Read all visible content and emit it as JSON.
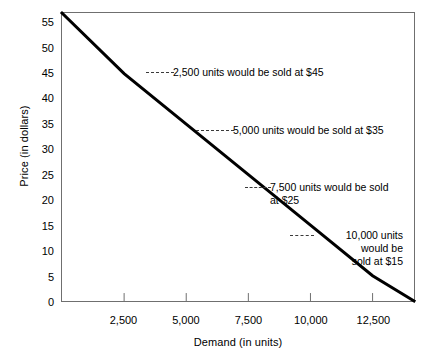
{
  "chart_data": {
    "type": "line",
    "title": "",
    "xlabel": "Demand (in units)",
    "ylabel": "Price (in dollars)",
    "xlim": [
      0,
      14167
    ],
    "ylim": [
      0,
      57
    ],
    "grid": false,
    "legend": "none",
    "x_ticks": [
      2500,
      5000,
      7500,
      10000,
      12500
    ],
    "x_tick_labels": [
      "2,500",
      "5,000",
      "7,500",
      "10,000",
      "12,500"
    ],
    "y_ticks": [
      0,
      5,
      10,
      15,
      20,
      25,
      30,
      35,
      40,
      45,
      50,
      55
    ],
    "y_tick_labels": [
      "0",
      "5",
      "10",
      "15",
      "20",
      "25",
      "30",
      "35",
      "40",
      "45",
      "50",
      "55"
    ],
    "series": [
      {
        "name": "Demand curve",
        "color": "#000000",
        "x": [
          0,
          2500,
          5000,
          7500,
          10000,
          12500,
          14167
        ],
        "values": [
          57,
          45,
          35,
          25,
          15,
          5,
          0
        ]
      }
    ],
    "annotations": [
      {
        "text": "2,500 units would be sold at $45",
        "x": 2500,
        "y": 45
      },
      {
        "text": "5,000 units would be sold at $35",
        "x": 5000,
        "y": 35
      },
      {
        "text": "7,500 units would be sold\nat $25",
        "x": 7500,
        "y": 25
      },
      {
        "text": "10,000 units\nwould be\nsold at $15",
        "x": 10000,
        "y": 15
      }
    ]
  },
  "colors": {
    "line": "#000000",
    "frame": "#6f6f6f",
    "text": "#000000",
    "leader": "#3a3a3a",
    "background": "#ffffff"
  }
}
